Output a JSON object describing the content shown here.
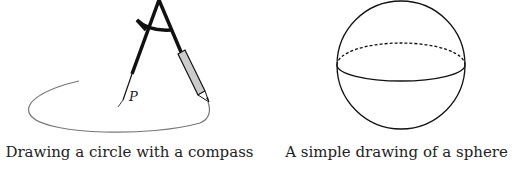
{
  "figures": [
    {
      "id": "compass",
      "caption": "Drawing a circle with a compass",
      "point_label": "P",
      "colors": {
        "stroke": "#111111",
        "arc": "#777777",
        "pencil_fill": "#cccccc"
      }
    },
    {
      "id": "sphere",
      "caption": "A simple drawing of a sphere",
      "colors": {
        "stroke": "#111111"
      }
    }
  ]
}
